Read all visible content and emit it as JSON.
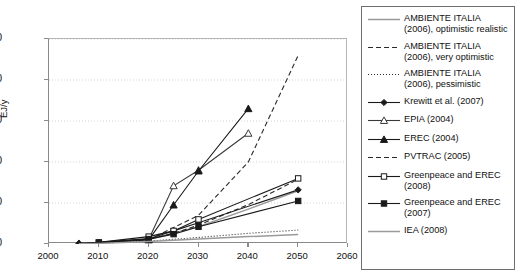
{
  "chart_data": {
    "type": "line",
    "title": "",
    "xlabel": "",
    "ylabel": "EJ/y",
    "xlim": [
      2000,
      2060
    ],
    "ylim": [
      0,
      50
    ],
    "xticks": [
      "2000",
      "2010",
      "2020",
      "2030",
      "2040",
      "2050",
      "2060"
    ],
    "yticks": [
      "0",
      "10",
      "20",
      "30",
      "40",
      "50"
    ],
    "grid": "horizontal-dotted",
    "legend_position": "right-outside",
    "series": [
      {
        "name": "AMBIENTE ITALIA (2006), optimistic realistic",
        "style": "solid",
        "color": "#9a9a9a",
        "marker": "none",
        "x": [
          2006,
          2010,
          2020,
          2030,
          2040,
          2050
        ],
        "y": [
          0.1,
          0.3,
          1.1,
          4.2,
          8.5,
          13.0
        ]
      },
      {
        "name": "AMBIENTE ITALIA (2006), very optimistic",
        "style": "dashed",
        "color": "#2a2a2a",
        "marker": "none",
        "x": [
          2006,
          2010,
          2020,
          2025,
          2030,
          2040,
          2050
        ],
        "y": [
          0.1,
          0.3,
          1.2,
          2.6,
          4.6,
          9.6,
          15.8
        ]
      },
      {
        "name": "AMBIENTE ITALIA (2006), pessimistic",
        "style": "dotted",
        "color": "#2a2a2a",
        "marker": "none",
        "x": [
          2006,
          2010,
          2020,
          2030,
          2040,
          2050
        ],
        "y": [
          0.1,
          0.2,
          0.7,
          1.6,
          2.6,
          3.4
        ]
      },
      {
        "name": "Krewitt et al. (2007)",
        "style": "solid",
        "color": "#1a1a1a",
        "marker": "diamond-filled",
        "x": [
          2006,
          2010,
          2020,
          2025,
          2030,
          2050
        ],
        "y": [
          0.15,
          0.4,
          1.3,
          3.2,
          5.2,
          13.2
        ]
      },
      {
        "name": "EPIA (2004)",
        "style": "solid",
        "color": "#3a3a3a",
        "marker": "triangle-open",
        "x": [
          2020,
          2025,
          2030,
          2040
        ],
        "y": [
          1.1,
          14.2,
          18.0,
          27.0
        ]
      },
      {
        "name": "EREC (2004)",
        "style": "solid",
        "color": "#1a1a1a",
        "marker": "triangle-filled",
        "x": [
          2006,
          2010,
          2020,
          2025,
          2030,
          2040
        ],
        "y": [
          0.1,
          0.3,
          1.0,
          9.5,
          17.8,
          33.0
        ]
      },
      {
        "name": "PVTRAC (2005)",
        "style": "dashed",
        "color": "#2a2a2a",
        "marker": "none",
        "x": [
          2020,
          2030,
          2040,
          2050
        ],
        "y": [
          1.0,
          7.0,
          20.0,
          46.0
        ]
      },
      {
        "name": "Greenpeace and EREC (2008)",
        "style": "solid",
        "color": "#1a1a1a",
        "marker": "square-open",
        "x": [
          2010,
          2020,
          2025,
          2030,
          2050
        ],
        "y": [
          0.4,
          1.8,
          3.2,
          6.0,
          16.0
        ]
      },
      {
        "name": "Greenpeace and EREC (2007)",
        "style": "solid",
        "color": "#1a1a1a",
        "marker": "square-filled",
        "x": [
          2010,
          2020,
          2025,
          2030,
          2050
        ],
        "y": [
          0.3,
          1.2,
          2.4,
          4.2,
          10.5
        ]
      },
      {
        "name": "IEA (2008)",
        "style": "solid",
        "color": "#9a9a9a",
        "marker": "none",
        "x": [
          2006,
          2010,
          2020,
          2030,
          2040,
          2050
        ],
        "y": [
          0.05,
          0.15,
          0.6,
          1.2,
          1.8,
          2.3
        ]
      }
    ]
  },
  "legend": {
    "items": [
      {
        "label": "AMBIENTE ITALIA (2006), optimistic realistic"
      },
      {
        "label": "AMBIENTE ITALIA (2006), very optimistic"
      },
      {
        "label": "AMBIENTE ITALIA (2006), pessimistic"
      },
      {
        "label": "Krewitt et al. (2007)"
      },
      {
        "label": "EPIA (2004)"
      },
      {
        "label": "EREC (2004)"
      },
      {
        "label": "PVTRAC (2005)"
      },
      {
        "label": "Greenpeace and EREC (2008)"
      },
      {
        "label": "Greenpeace and EREC (2007)"
      },
      {
        "label": "IEA (2008)"
      }
    ]
  }
}
